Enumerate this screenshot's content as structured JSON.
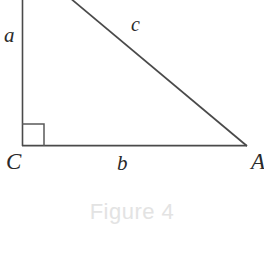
{
  "figure": {
    "caption": "Figure 4",
    "caption_color": "#e3e3e3",
    "background_color": "#ffffff",
    "stroke_color": "#4a4a4a",
    "label_color": "#2a2a2a"
  },
  "diagram": {
    "type": "right-triangle",
    "vertices": [
      {
        "name": "C",
        "label": "C",
        "x": 22,
        "y": 146
      },
      {
        "name": "A",
        "label": "A",
        "x": 247,
        "y": 146
      },
      {
        "name": "B",
        "label": "",
        "x": 22,
        "y": -60
      }
    ],
    "sides": [
      {
        "name": "leg-vertical",
        "label": "a",
        "from": "C",
        "to": "B"
      },
      {
        "name": "leg-horizontal",
        "label": "b",
        "from": "C",
        "to": "A"
      },
      {
        "name": "hypotenuse",
        "label": "c",
        "from": "B",
        "to": "A"
      }
    ],
    "right_angle_marker": {
      "at": "C",
      "x": 22,
      "y": 124,
      "size": 22
    },
    "labels": {
      "a": "a",
      "b": "b",
      "c": "c",
      "vertex_C": "C",
      "vertex_A": "A"
    }
  }
}
